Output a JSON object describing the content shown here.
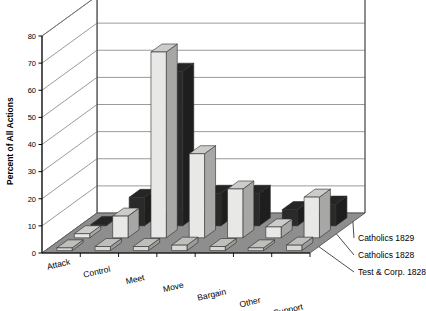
{
  "chart_data": {
    "type": "bar",
    "subtype": "3d-grouped-bar",
    "title": "",
    "xlabel": "",
    "ylabel": "Percent of All Actions",
    "ylim": [
      0,
      80
    ],
    "ytick_step": 10,
    "yticks": [
      "0",
      "10",
      "20",
      "30",
      "40",
      "50",
      "60",
      "70",
      "80"
    ],
    "grid": true,
    "legend_position": "right-floor",
    "categories": [
      "Attack",
      "Control",
      "Meet",
      "Move",
      "Bargain",
      "Other",
      "Support"
    ],
    "series": [
      {
        "name": "Catholics 1829",
        "color": "#2a2a2a",
        "values": [
          0.5,
          10.5,
          57,
          12,
          12,
          6,
          8
        ]
      },
      {
        "name": "Catholics 1828",
        "color": "#e8e8e6",
        "values": [
          1.5,
          8,
          68.5,
          31,
          18,
          4,
          15
        ]
      },
      {
        "name": "Test & Corp. 1828",
        "color": "#d8d8d4",
        "values": [
          1,
          1.5,
          1.5,
          2,
          1.5,
          1,
          2
        ]
      }
    ]
  },
  "axis": {
    "y_title": "Percent of All Actions"
  },
  "legend": {
    "items": [
      {
        "label": "Catholics 1829"
      },
      {
        "label": "Catholics 1828"
      },
      {
        "label": "Test & Corp. 1828"
      }
    ]
  }
}
